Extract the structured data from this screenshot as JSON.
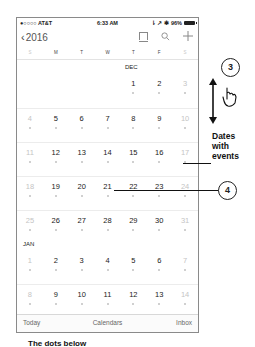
{
  "status_bar": {
    "carrier": "●○○○○ AT&T",
    "wifi_icon": "wifi-icon",
    "time": "6:33 AM",
    "battery_percent": "96%",
    "indicators": "⇂ ↗ ✱"
  },
  "nav_bar": {
    "back_label": "2016",
    "back_icon": "chevron-left-icon",
    "icons": [
      "list-view-icon",
      "search-icon",
      "add-icon"
    ]
  },
  "weekdays": [
    "S",
    "M",
    "T",
    "W",
    "T",
    "F",
    "S"
  ],
  "months": [
    {
      "label": "DEC",
      "weeks": [
        [
          "",
          "",
          "",
          "",
          "1",
          "2",
          "3"
        ],
        [
          "4",
          "5",
          "6",
          "7",
          "8",
          "9",
          "10"
        ],
        [
          "11",
          "12",
          "13",
          "14",
          "15",
          "16",
          "17"
        ],
        [
          "18",
          "19",
          "20",
          "21",
          "22",
          "23",
          "24"
        ],
        [
          "25",
          "26",
          "27",
          "28",
          "29",
          "30",
          "31"
        ]
      ]
    },
    {
      "label": "JAN",
      "weeks": [
        [
          "1",
          "2",
          "3",
          "4",
          "5",
          "6",
          "7"
        ],
        [
          "8",
          "9",
          "10",
          "11",
          "12",
          "13",
          "14"
        ]
      ]
    }
  ],
  "toolbar": {
    "today": "Today",
    "calendars": "Calendars",
    "inbox": "Inbox"
  },
  "annotations": {
    "step3": "3",
    "step4": "4",
    "dates_with_events": [
      "Dates",
      "with",
      "events"
    ],
    "gesture_icon": "swipe-vertical-hand-icon"
  },
  "caption": "The dots below"
}
